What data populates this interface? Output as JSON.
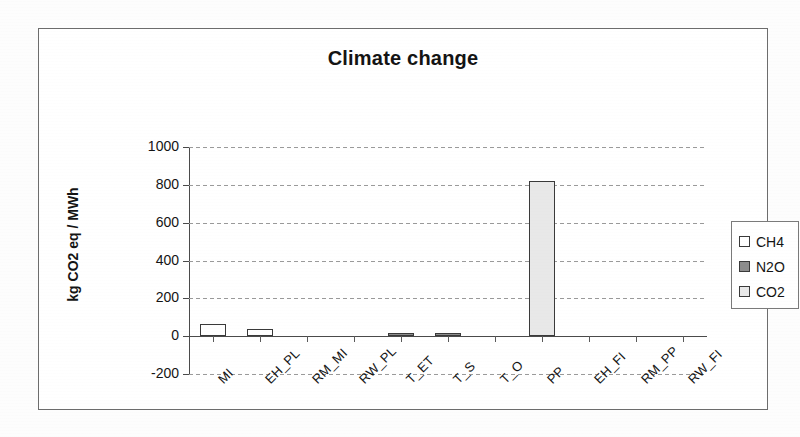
{
  "chart_data": {
    "type": "bar",
    "title": "Climate change",
    "xlabel": "",
    "ylabel": "kg CO2 eq / MWh",
    "ylim": [
      -200,
      1000
    ],
    "yticks": [
      -200,
      0,
      200,
      400,
      600,
      800,
      1000
    ],
    "ytick_labels": [
      "-200",
      "0",
      "200",
      "400",
      "600",
      "800",
      "1000"
    ],
    "grid": true,
    "legend_position": "right",
    "categories": [
      "MI",
      "EH_PL",
      "RM_MI",
      "RW_PL",
      "T_ET",
      "T_S",
      "T_O",
      "PP",
      "EH_FI",
      "RM_PP",
      "RW_FI"
    ],
    "series": [
      {
        "name": "CH4",
        "color": "#ffffff",
        "values": [
          0,
          0,
          0,
          0,
          0,
          0,
          0,
          0,
          0,
          0,
          0
        ]
      },
      {
        "name": "N2O",
        "color": "#8d8d8d",
        "values": [
          0,
          0,
          0,
          0,
          16,
          14,
          0,
          0,
          0,
          0,
          0
        ]
      },
      {
        "name": "CO2",
        "color": "#e8e8e8",
        "values": [
          65,
          40,
          0,
          0,
          0,
          0,
          0,
          820,
          0,
          0,
          0
        ]
      }
    ],
    "bars": [
      {
        "category": "MI",
        "series": "CH4",
        "value": 65,
        "style": "ch4"
      },
      {
        "category": "EH_PL",
        "series": "CH4",
        "value": 40,
        "style": "ch4"
      },
      {
        "category": "RM_MI",
        "series": "CO2",
        "value": 0,
        "style": "co2"
      },
      {
        "category": "RW_PL",
        "series": "CO2",
        "value": 0,
        "style": "co2"
      },
      {
        "category": "T_ET",
        "series": "N2O",
        "value": 16,
        "style": "n2o"
      },
      {
        "category": "T_S",
        "series": "N2O",
        "value": 14,
        "style": "n2o"
      },
      {
        "category": "T_O",
        "series": "CO2",
        "value": 0,
        "style": "co2"
      },
      {
        "category": "PP",
        "series": "CO2",
        "value": 820,
        "style": "co2"
      },
      {
        "category": "EH_FI",
        "series": "CO2",
        "value": 0,
        "style": "co2"
      },
      {
        "category": "RM_PP",
        "series": "CO2",
        "value": 0,
        "style": "co2"
      },
      {
        "category": "RW_FI",
        "series": "CO2",
        "value": 0,
        "style": "co2"
      }
    ]
  },
  "legend": {
    "items": [
      {
        "label": "CH4",
        "swatch": "ch4"
      },
      {
        "label": "N2O",
        "swatch": "n2o"
      },
      {
        "label": "CO2",
        "swatch": "co2"
      }
    ]
  },
  "colors": {
    "ch4": "#ffffff",
    "n2o": "#8d8d8d",
    "co2": "#e8e8e8",
    "axis": "#4a4a4a",
    "grid": "#9a9a9a",
    "text": "#141414",
    "frame": "#6d6d6d"
  }
}
